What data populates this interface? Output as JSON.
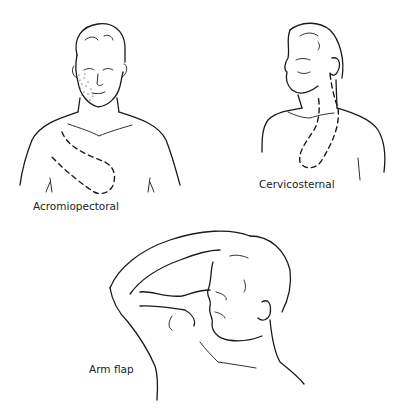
{
  "figure": {
    "panels": [
      {
        "id": "acromiopectoral",
        "label": "Acromiopectoral",
        "view": "frontal head and chest with dashed flap outline from shoulder to chest, stippled cheek"
      },
      {
        "id": "cervicosternal",
        "label": "Cervicosternal",
        "view": "three-quarter head and chest with dashed flap outline from neck down to sternum"
      },
      {
        "id": "arm-flap",
        "label": "Arm flap",
        "view": "profile head with raised arm flap attached to nose"
      }
    ]
  },
  "colors": {
    "line": "#1a1a1a",
    "background": "#ffffff"
  }
}
